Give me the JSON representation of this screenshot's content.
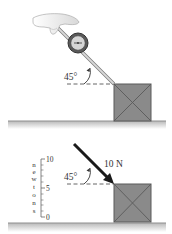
{
  "top_panel": {
    "angle_label": "45°",
    "description": "hand pulling spring scale at angle on box"
  },
  "bottom_panel": {
    "angle_label": "45°",
    "force_label": "10 N",
    "scale": {
      "unit_letters": [
        "n",
        "e",
        "w",
        "t",
        "o",
        "n",
        "s"
      ],
      "ticks": {
        "max": "10",
        "mid": "5",
        "min": "0"
      }
    }
  },
  "colors": {
    "box_fill": "#8a8a8a",
    "box_edge": "#5a5a5a",
    "floor": "#9a9a9a",
    "arrow": "#1a1a1a",
    "rod": "#c8c8c8"
  }
}
